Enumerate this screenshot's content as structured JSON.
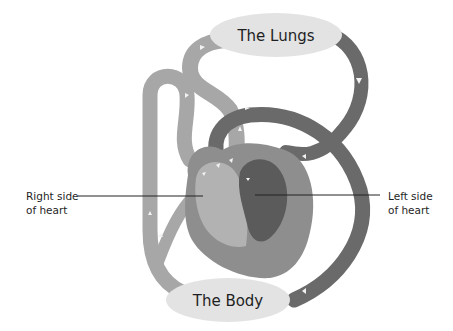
{
  "diagram": {
    "title": "",
    "nodes": {
      "lungs": {
        "label": "The Lungs"
      },
      "body": {
        "label": "The Body"
      }
    },
    "callouts": {
      "right_heart": {
        "line1": "Right side",
        "line2": "of heart"
      },
      "left_heart": {
        "line1": "Left side",
        "line2": "of heart"
      }
    },
    "colors": {
      "deoxygenated": "#a7a7a7",
      "oxygenated": "#6a6a6a",
      "node_fill": "#e3e3e3",
      "heart_outer": "#8e8e8e",
      "right_chamber": "#b2b2b2",
      "left_chamber": "#5b5b5b",
      "arrow": "#f2f2f2",
      "leader_line": "#222222"
    }
  }
}
